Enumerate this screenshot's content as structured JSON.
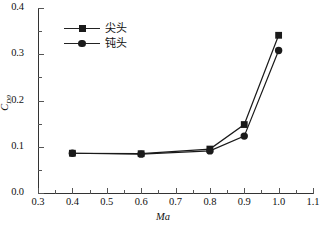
{
  "chart_data": {
    "type": "line",
    "title": "",
    "xlabel": "Ma",
    "ylabel": "C_D0",
    "ylabel_base": "C",
    "ylabel_sub": "D0",
    "xlim": [
      0.3,
      1.1
    ],
    "ylim": [
      0.0,
      0.4
    ],
    "xticks": [
      "0.3",
      "0.4",
      "0.5",
      "0.6",
      "0.7",
      "0.8",
      "0.9",
      "1.0",
      "1.1"
    ],
    "xtick_values": [
      0.3,
      0.4,
      0.5,
      0.6,
      0.7,
      0.8,
      0.9,
      1.0,
      1.1
    ],
    "yticks": [
      "0.0",
      "0.1",
      "0.2",
      "0.3",
      "0.4"
    ],
    "ytick_values": [
      0.0,
      0.1,
      0.2,
      0.3,
      0.4
    ],
    "x_minor_values": [
      0.35,
      0.45,
      0.55,
      0.65,
      0.75,
      0.85,
      0.95,
      1.05
    ],
    "y_minor_values": [
      0.05,
      0.15,
      0.25,
      0.35
    ],
    "grid": false,
    "legend_position": "top-left-inside",
    "x": [
      0.4,
      0.6,
      0.8,
      0.9,
      1.0
    ],
    "series": [
      {
        "name": "尖头",
        "marker": "square",
        "color": "#1a1a1a",
        "values": [
          0.086,
          0.085,
          0.095,
          0.148,
          0.341
        ]
      },
      {
        "name": "钝头",
        "marker": "circle",
        "color": "#1a1a1a",
        "values": [
          0.086,
          0.084,
          0.091,
          0.123,
          0.308
        ]
      }
    ]
  },
  "legend": {
    "items": [
      {
        "label": "尖头",
        "marker": "square"
      },
      {
        "label": "钝头",
        "marker": "circle"
      }
    ]
  }
}
